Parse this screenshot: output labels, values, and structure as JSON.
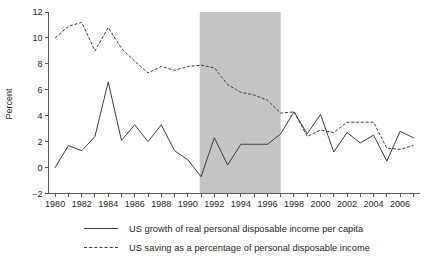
{
  "chart_data": {
    "type": "line",
    "title": "",
    "xlabel": "",
    "ylabel": "Percent",
    "grid": false,
    "legend_position": "bottom",
    "xlim": [
      1979.5,
      2007.5
    ],
    "ylim": [
      -2,
      12
    ],
    "x_ticks": [
      1980,
      1982,
      1984,
      1986,
      1988,
      1990,
      1992,
      1994,
      1996,
      1998,
      2000,
      2002,
      2004,
      2006
    ],
    "x_tick_labels": [
      "1980",
      "1982",
      "1984",
      "1986",
      "1988",
      "1990",
      "1992",
      "1994",
      "1996",
      "1998",
      "2000",
      "2002",
      "2004",
      "2006"
    ],
    "y_ticks": [
      -2,
      0,
      2,
      4,
      6,
      8,
      10,
      12
    ],
    "y_tick_labels": [
      "−2",
      "0",
      "2",
      "4",
      "6",
      "8",
      "10",
      "12"
    ],
    "x": [
      1980,
      1981,
      1982,
      1983,
      1984,
      1985,
      1986,
      1987,
      1988,
      1989,
      1990,
      1991,
      1992,
      1993,
      1994,
      1995,
      1996,
      1997,
      1998,
      1999,
      2000,
      2001,
      2002,
      2003,
      2004,
      2005,
      2006,
      2007
    ],
    "series": [
      {
        "name": "US growth of real personal disposable income per capita",
        "style": "solid",
        "color": "#3b3b3d",
        "values": [
          0.0,
          1.7,
          1.3,
          2.4,
          6.6,
          2.1,
          3.3,
          2.0,
          3.3,
          1.3,
          0.6,
          -0.7,
          2.3,
          0.2,
          1.8,
          1.8,
          1.8,
          2.6,
          4.3,
          2.6,
          4.1,
          1.2,
          2.7,
          1.9,
          2.5,
          0.5,
          2.8,
          2.3
        ],
        "shaded_band_label": "1991–1997"
      },
      {
        "name": "US saving as a percentage of personal disposable income",
        "style": "dashed",
        "color": "#3b3b3d",
        "values": [
          10.0,
          10.9,
          11.2,
          9.0,
          10.8,
          9.2,
          8.2,
          7.3,
          7.8,
          7.5,
          7.8,
          7.9,
          7.7,
          6.4,
          5.8,
          5.6,
          5.2,
          4.2,
          4.3,
          2.4,
          2.9,
          2.7,
          3.5,
          3.5,
          3.5,
          1.5,
          1.4,
          1.7
        ]
      }
    ],
    "shaded_region": {
      "label": "highlighted period",
      "x_start": 1990.9,
      "x_end": 1997.0,
      "color": "#c3c4c6"
    }
  },
  "legend": {
    "entries": [
      {
        "label": "US growth of real personal disposable income per capita",
        "style": "solid"
      },
      {
        "label": "US saving as a percentage of personal disposable income",
        "style": "dashed"
      }
    ]
  }
}
